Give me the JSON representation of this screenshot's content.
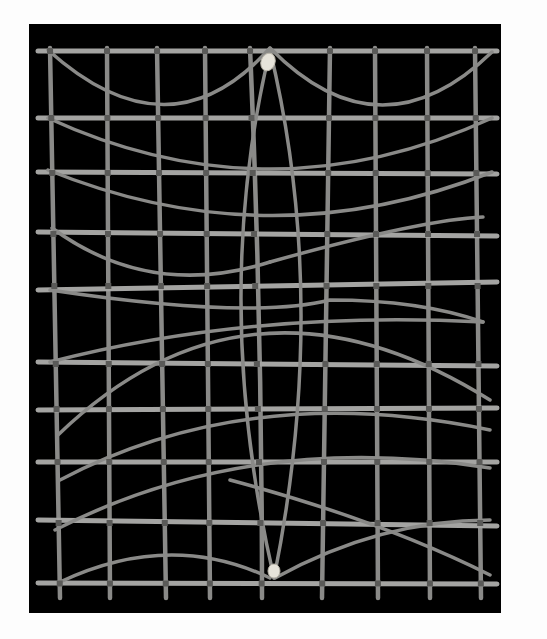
{
  "image": {
    "subject": "Marshall Islands stick navigation chart",
    "description": "Lattice of straight horizontal and vertical sticks with curved sticks tied across, mounted on a black background with two shells marking islands",
    "background_color": "#000000",
    "border_color": "#fdfdfd",
    "stick_color": "#8a8a88",
    "shell_color": "#e6e3da",
    "counts": {
      "vertical_sticks": 9,
      "horizontal_sticks": 10,
      "shells": 2
    }
  }
}
